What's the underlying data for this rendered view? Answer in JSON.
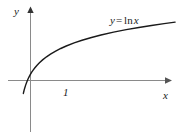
{
  "figure": {
    "background_color": "#ffffff",
    "width": 183,
    "height": 140,
    "axis_color": "#8a8a8a",
    "curve_color": "#1a1a1a",
    "text_color": "#1a1a1a"
  },
  "labels": {
    "y_axis": "y",
    "x_axis": "x",
    "tick_one": "1",
    "equation_lhs": "y",
    "equation_operator": "=",
    "equation_function": "ln",
    "equation_variable": "x",
    "equation_full": "y = ln x"
  },
  "chart_data": {
    "type": "line",
    "title": "",
    "subtitle": "",
    "xlabel": "x",
    "ylabel": "y",
    "legend": [
      "y = ln x"
    ],
    "legend_position": "inline-upper-right",
    "grid": false,
    "annotations": [
      {
        "text": "y = ln x",
        "x": 7.4,
        "y": 2.35
      },
      {
        "text": "1",
        "x": 1.1,
        "y": -0.35
      }
    ],
    "axis_arrows": {
      "x": "right",
      "y": "up"
    },
    "xlim": [
      -1.2,
      10.4
    ],
    "ylim": [
      -3.6,
      3.4
    ],
    "x_ticks": [
      1
    ],
    "x_tick_labels": [
      "1"
    ],
    "y_ticks": [],
    "y_tick_labels": [],
    "series": [
      {
        "name": "y = ln x",
        "formula": "y = ln x",
        "x": [
          0.28,
          0.32,
          0.36,
          0.42,
          0.48,
          0.55,
          0.62,
          0.7,
          0.8,
          0.9,
          1.0,
          1.15,
          1.3,
          1.5,
          1.75,
          2.0,
          2.3,
          2.65,
          3.0,
          3.5,
          4.0,
          4.6,
          5.2,
          6.0,
          6.8,
          7.6,
          8.4,
          9.2,
          9.9
        ],
        "y": [
          -1.273,
          -1.139,
          -1.022,
          -0.868,
          -0.734,
          -0.598,
          -0.478,
          -0.357,
          -0.223,
          -0.105,
          0.0,
          0.14,
          0.262,
          0.405,
          0.56,
          0.693,
          0.833,
          0.975,
          1.099,
          1.253,
          1.386,
          1.526,
          1.649,
          1.792,
          1.917,
          2.028,
          2.128,
          2.219,
          2.293
        ]
      }
    ]
  }
}
